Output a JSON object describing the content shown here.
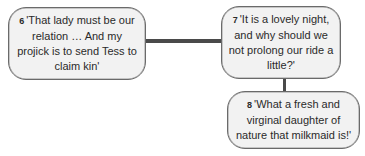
{
  "diagram": {
    "nodes": [
      {
        "id": "6",
        "number": "6",
        "quote": "'That lady must be our relation … And my projick is to send Tess to claim kin'"
      },
      {
        "id": "7",
        "number": "7",
        "quote": "'It is a lovely night, and why should we not prolong our ride a little?'"
      },
      {
        "id": "8",
        "number": "8",
        "quote": "'What a fresh and virginal daughter of nature that milkmaid is!'"
      }
    ],
    "edges": [
      {
        "from": "6",
        "to": "7",
        "orientation": "horizontal"
      },
      {
        "from": "7",
        "to": "8",
        "orientation": "vertical"
      }
    ],
    "colors": {
      "box_fill": "#f2f2f2",
      "box_border": "#6a6a6a",
      "connector": "#4a4a4a",
      "text": "#2a2a2a"
    }
  }
}
